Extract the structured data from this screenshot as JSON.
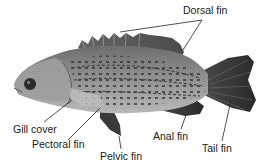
{
  "diagram": {
    "labels": [
      {
        "id": "dorsal",
        "text": "Dorsal fin",
        "x": 183,
        "y": 4
      },
      {
        "id": "gill",
        "text": "Gill cover",
        "x": 13,
        "y": 123
      },
      {
        "id": "pectoral",
        "text": "Pectoral fin",
        "x": 32,
        "y": 138
      },
      {
        "id": "pelvic",
        "text": "Pelvic fin",
        "x": 100,
        "y": 150
      },
      {
        "id": "anal",
        "text": "Anal fin",
        "x": 153,
        "y": 130
      },
      {
        "id": "tail",
        "text": "Tail fin",
        "x": 202,
        "y": 142
      }
    ],
    "colors": {
      "background": "#ffffff",
      "text": "#1a1a1a",
      "leader_line": "#222222",
      "fish_body": "#8a8a8a",
      "fish_dark": "#3c3c3c",
      "fish_light": "#c4c4c4"
    }
  }
}
